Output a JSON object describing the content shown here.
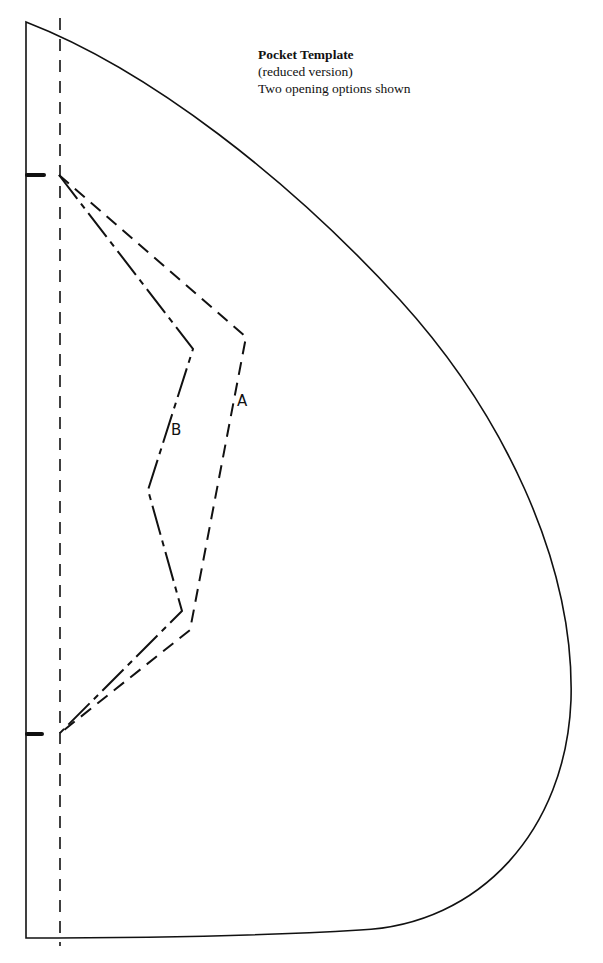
{
  "caption": {
    "title": "Pocket Template",
    "subtitle": "(reduced version)",
    "note": "Two opening options shown"
  },
  "options": [
    {
      "id": "A",
      "label": "A",
      "line_style": "dashed"
    },
    {
      "id": "B",
      "label": "B",
      "line_style": "dash-dot"
    }
  ],
  "colors": {
    "ink": "#111111",
    "paper": "#ffffff"
  }
}
